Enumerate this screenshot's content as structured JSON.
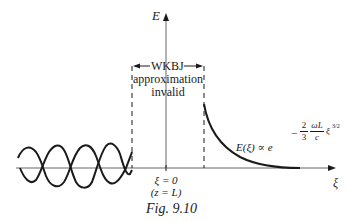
{
  "axes": {
    "y_label": "E",
    "x_label": "ξ"
  },
  "region_label": {
    "line1": "WKBJ",
    "line2": "approximation",
    "line3": "invalid"
  },
  "origin_label": {
    "line1": "ξ = 0",
    "line2": "(z = L)"
  },
  "formula": {
    "lhs": "E(ξ) ∝ e",
    "exp_sign": "−",
    "frac1_num": "2",
    "frac1_den": "3",
    "frac2_num": "ωL",
    "frac2_den": "c",
    "exp_var": "ξ",
    "exp_power": "3/2"
  },
  "caption": "Fig. 9.10",
  "colors": {
    "line": "#1a1a1a",
    "axis": "#555555"
  }
}
